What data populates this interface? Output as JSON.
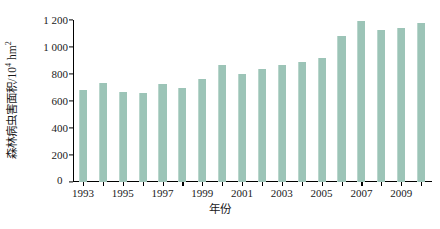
{
  "chart_data": {
    "type": "bar",
    "title": "",
    "xlabel": "年份",
    "ylabel": "森林病虫害面积/10⁴ hm²",
    "ylabel_main": "森林病虫害面积/10",
    "ylabel_exp": "4",
    "ylabel_unit": " hm",
    "ylabel_unit_exp": "2",
    "categories": [
      "1993",
      "1994",
      "1995",
      "1996",
      "1997",
      "1998",
      "1999",
      "2000",
      "2001",
      "2002",
      "2003",
      "2004",
      "2005",
      "2006",
      "2007",
      "2008",
      "2009",
      "2010"
    ],
    "values": [
      680,
      735,
      665,
      660,
      725,
      695,
      760,
      865,
      800,
      835,
      865,
      890,
      920,
      1080,
      1190,
      1125,
      1140,
      1180
    ],
    "ylim": [
      0,
      1200
    ],
    "yticks": [
      0,
      200,
      400,
      600,
      800,
      1000,
      1200
    ],
    "ytick_labels": [
      "0",
      "200",
      "400",
      "600",
      "800",
      "1 000",
      "1 200"
    ],
    "xtick_labels": [
      "1993",
      "1995",
      "1997",
      "1999",
      "2001",
      "2003",
      "2005",
      "2007",
      "2009"
    ],
    "xtick_years": [
      1993,
      1995,
      1997,
      1999,
      2001,
      2003,
      2005,
      2007,
      2009
    ],
    "grid": false,
    "legend": null,
    "bar_color": "#9cc4b7",
    "axis_color": "#000000",
    "background_color": "#ffffff"
  }
}
